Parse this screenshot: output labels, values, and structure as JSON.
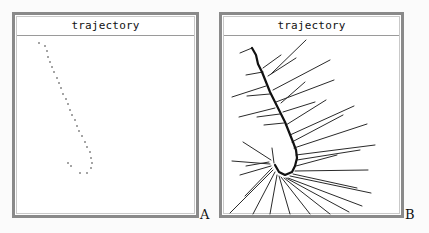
{
  "panels": [
    {
      "id": "A",
      "title": "trajectory",
      "label": "A",
      "style": "dotted",
      "points": [
        [
          39,
          43
        ],
        [
          45,
          46
        ],
        [
          47,
          51
        ],
        [
          48,
          57
        ],
        [
          50,
          62
        ],
        [
          52,
          67
        ],
        [
          54,
          72
        ],
        [
          57,
          78
        ],
        [
          59,
          83
        ],
        [
          61,
          88
        ],
        [
          63,
          94
        ],
        [
          66,
          99
        ],
        [
          68,
          104
        ],
        [
          70,
          110
        ],
        [
          72,
          115
        ],
        [
          75,
          120
        ],
        [
          77,
          126
        ],
        [
          79,
          131
        ],
        [
          82,
          136
        ],
        [
          85,
          142
        ],
        [
          87,
          147
        ],
        [
          90,
          152
        ],
        [
          91,
          158
        ],
        [
          92,
          163
        ],
        [
          91,
          168
        ],
        [
          87,
          173
        ],
        [
          80,
          173
        ],
        [
          71,
          166
        ],
        [
          68,
          163
        ]
      ]
    },
    {
      "id": "B",
      "title": "trajectory",
      "label": "B",
      "style": "lines",
      "stem": [
        [
          252,
          48
        ],
        [
          256,
          55
        ],
        [
          258,
          64
        ],
        [
          262,
          72
        ],
        [
          266,
          82
        ],
        [
          270,
          92
        ],
        [
          275,
          102
        ],
        [
          280,
          112
        ],
        [
          285,
          122
        ],
        [
          289,
          132
        ],
        [
          293,
          142
        ],
        [
          296,
          150
        ],
        [
          297,
          158
        ],
        [
          295,
          166
        ],
        [
          292,
          172
        ],
        [
          285,
          175
        ],
        [
          279,
          172
        ],
        [
          275,
          165
        ]
      ],
      "branches": [
        [
          [
            240,
            53
          ],
          [
            252,
            48
          ]
        ],
        [
          [
            246,
            75
          ],
          [
            263,
            72
          ]
        ],
        [
          [
            232,
            97
          ],
          [
            266,
            86
          ]
        ],
        [
          [
            247,
            96
          ],
          [
            270,
            94
          ]
        ],
        [
          [
            239,
            117
          ],
          [
            275,
            108
          ]
        ],
        [
          [
            257,
            117
          ],
          [
            280,
            114
          ]
        ],
        [
          [
            264,
            125
          ],
          [
            284,
            123
          ]
        ],
        [
          [
            263,
            68
          ],
          [
            281,
            55
          ]
        ],
        [
          [
            268,
            76
          ],
          [
            296,
            58
          ]
        ],
        [
          [
            271,
            74
          ],
          [
            306,
            40
          ]
        ],
        [
          [
            273,
            90
          ],
          [
            330,
            60
          ]
        ],
        [
          [
            276,
            102
          ],
          [
            334,
            80
          ]
        ],
        [
          [
            281,
            103
          ],
          [
            305,
            82
          ]
        ],
        [
          [
            283,
            112
          ],
          [
            315,
            102
          ]
        ],
        [
          [
            286,
            125
          ],
          [
            326,
            100
          ]
        ],
        [
          [
            290,
            135
          ],
          [
            354,
            106
          ]
        ],
        [
          [
            292,
            142
          ],
          [
            343,
            115
          ]
        ],
        [
          [
            294,
            148
          ],
          [
            367,
            124
          ]
        ],
        [
          [
            296,
            155
          ],
          [
            375,
            145
          ]
        ],
        [
          [
            297,
            160
          ],
          [
            360,
            150
          ]
        ],
        [
          [
            296,
            166
          ],
          [
            337,
            155
          ]
        ],
        [
          [
            295,
            171
          ],
          [
            368,
            170
          ]
        ],
        [
          [
            293,
            174
          ],
          [
            357,
            188
          ]
        ],
        [
          [
            290,
            176
          ],
          [
            371,
            193
          ]
        ],
        [
          [
            288,
            178
          ],
          [
            362,
            206
          ]
        ],
        [
          [
            286,
            178
          ],
          [
            349,
            212
          ]
        ],
        [
          [
            284,
            178
          ],
          [
            330,
            214
          ]
        ],
        [
          [
            281,
            177
          ],
          [
            310,
            214
          ]
        ],
        [
          [
            279,
            176
          ],
          [
            290,
            214
          ]
        ],
        [
          [
            277,
            175
          ],
          [
            270,
            214
          ]
        ],
        [
          [
            275,
            172
          ],
          [
            253,
            214
          ]
        ],
        [
          [
            273,
            170
          ],
          [
            230,
            213
          ]
        ],
        [
          [
            272,
            168
          ],
          [
            245,
            196
          ]
        ],
        [
          [
            271,
            166
          ],
          [
            240,
            175
          ]
        ],
        [
          [
            270,
            164
          ],
          [
            232,
            161
          ]
        ],
        [
          [
            269,
            162
          ],
          [
            246,
            166
          ]
        ],
        [
          [
            271,
            160
          ],
          [
            243,
            142
          ]
        ],
        [
          [
            274,
            163
          ],
          [
            272,
            148
          ]
        ]
      ]
    }
  ]
}
